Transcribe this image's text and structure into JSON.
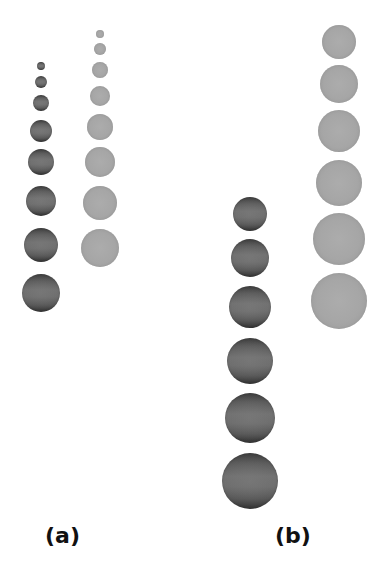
{
  "figure": {
    "panels": [
      {
        "label": "(a)",
        "label_position": {
          "x": 45,
          "y": 525
        },
        "columns": [
          {
            "shade": "dark",
            "color": "#5a5a5a",
            "center_x": 41,
            "spheres": [
              {
                "cy": 66,
                "r": 4
              },
              {
                "cy": 82,
                "r": 6
              },
              {
                "cy": 103,
                "r": 8
              },
              {
                "cy": 131,
                "r": 11
              },
              {
                "cy": 162,
                "r": 13
              },
              {
                "cy": 201,
                "r": 15
              },
              {
                "cy": 245,
                "r": 17
              },
              {
                "cy": 293,
                "r": 19
              }
            ]
          },
          {
            "shade": "light",
            "color": "#a6a6a6",
            "center_x": 100,
            "spheres": [
              {
                "cy": 34,
                "r": 4
              },
              {
                "cy": 49,
                "r": 6
              },
              {
                "cy": 70,
                "r": 8
              },
              {
                "cy": 96,
                "r": 10
              },
              {
                "cy": 127,
                "r": 13
              },
              {
                "cy": 162,
                "r": 15
              },
              {
                "cy": 203,
                "r": 17
              },
              {
                "cy": 248,
                "r": 19
              }
            ]
          }
        ]
      },
      {
        "label": "(b)",
        "label_position": {
          "x": 275,
          "y": 525
        },
        "columns": [
          {
            "shade": "dark",
            "color": "#5a5a5a",
            "center_x": 250,
            "spheres": [
              {
                "cy": 214,
                "r": 17
              },
              {
                "cy": 258,
                "r": 19
              },
              {
                "cy": 307,
                "r": 21
              },
              {
                "cy": 361,
                "r": 23
              },
              {
                "cy": 418,
                "r": 25
              },
              {
                "cy": 481,
                "r": 28
              }
            ]
          },
          {
            "shade": "light",
            "color": "#a6a6a6",
            "center_x": 339,
            "spheres": [
              {
                "cy": 42,
                "r": 17
              },
              {
                "cy": 84,
                "r": 19
              },
              {
                "cy": 131,
                "r": 21
              },
              {
                "cy": 183,
                "r": 23
              },
              {
                "cy": 239,
                "r": 26
              },
              {
                "cy": 301,
                "r": 28
              }
            ]
          }
        ]
      }
    ]
  }
}
